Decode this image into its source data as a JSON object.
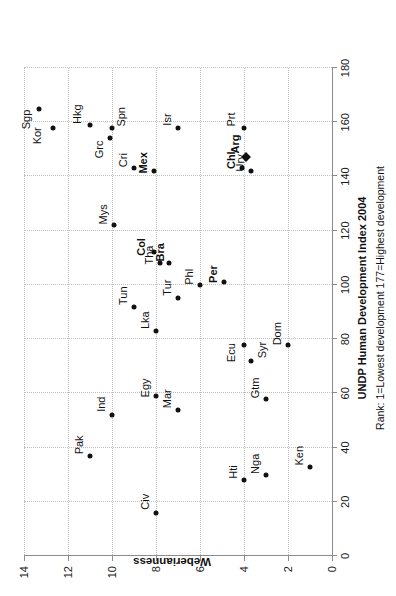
{
  "chart_data": {
    "type": "scatter",
    "title": "",
    "xlabel": "UNDP Human Development Index 2004",
    "xsublabel": "Rank: 1=Lowest development  177=Highest development",
    "ylabel": "Weberianness",
    "xlim": [
      0,
      180
    ],
    "ylim": [
      0,
      14
    ],
    "xticks": [
      0,
      20,
      40,
      60,
      80,
      100,
      120,
      140,
      160,
      180
    ],
    "yticks": [
      0,
      2,
      4,
      6,
      8,
      10,
      12,
      14
    ],
    "grid": "dotted-both",
    "legend": "none",
    "marker_colors": {
      "point": "#111111",
      "grid": "#bfbfbf",
      "axis": "#8c8c8c"
    },
    "points": [
      {
        "label": "Sgp",
        "x": 165,
        "y": 13.3,
        "bold": false,
        "marker": "circle",
        "lx": 161,
        "ly": 13.9
      },
      {
        "label": "Kor",
        "x": 158,
        "y": 12.7,
        "bold": false,
        "marker": "circle",
        "lx": 155,
        "ly": 13.4
      },
      {
        "label": "Hkg",
        "x": 159,
        "y": 11.0,
        "bold": false,
        "marker": "circle",
        "lx": 163,
        "ly": 11.6
      },
      {
        "label": "Grc",
        "x": 154,
        "y": 10.1,
        "bold": false,
        "marker": "circle",
        "lx": 150,
        "ly": 10.6
      },
      {
        "label": "Spn",
        "x": 158,
        "y": 10.0,
        "bold": false,
        "marker": "circle",
        "lx": 162,
        "ly": 9.6
      },
      {
        "label": "Isr",
        "x": 158,
        "y": 7.0,
        "bold": false,
        "marker": "circle",
        "lx": 161,
        "ly": 7.5
      },
      {
        "label": "Prt",
        "x": 158,
        "y": 4.0,
        "bold": false,
        "marker": "circle",
        "lx": 161,
        "ly": 4.6
      },
      {
        "label": "Cri",
        "x": 143,
        "y": 9.0,
        "bold": false,
        "marker": "circle",
        "lx": 146,
        "ly": 9.5
      },
      {
        "label": "Mex",
        "x": 142,
        "y": 8.1,
        "bold": true,
        "marker": "circle",
        "lx": 145,
        "ly": 8.6
      },
      {
        "label": "Chl",
        "x": 143,
        "y": 4.1,
        "bold": true,
        "marker": "circle",
        "lx": 146,
        "ly": 4.6
      },
      {
        "label": "Ury",
        "x": 142,
        "y": 3.7,
        "bold": false,
        "marker": "circle",
        "lx": 145,
        "ly": 4.2
      },
      {
        "label": "Arg",
        "x": 147,
        "y": 3.9,
        "bold": true,
        "marker": "diamond",
        "lx": 152,
        "ly": 4.4
      },
      {
        "label": "Mys",
        "x": 122,
        "y": 9.9,
        "bold": false,
        "marker": "circle",
        "lx": 126,
        "ly": 10.4
      },
      {
        "label": "Col",
        "x": 112,
        "y": 8.1,
        "bold": true,
        "marker": "circle",
        "lx": 114,
        "ly": 8.7
      },
      {
        "label": "Tha",
        "x": 108,
        "y": 7.8,
        "bold": false,
        "marker": "circle",
        "lx": 111,
        "ly": 8.3
      },
      {
        "label": "Bra",
        "x": 108,
        "y": 7.4,
        "bold": true,
        "marker": "circle",
        "lx": 112,
        "ly": 7.8
      },
      {
        "label": "Tun",
        "x": 92,
        "y": 9.0,
        "bold": false,
        "marker": "circle",
        "lx": 96,
        "ly": 9.5
      },
      {
        "label": "Lka",
        "x": 83,
        "y": 8.0,
        "bold": false,
        "marker": "circle",
        "lx": 87,
        "ly": 8.5
      },
      {
        "label": "Tur",
        "x": 95,
        "y": 7.0,
        "bold": false,
        "marker": "circle",
        "lx": 99,
        "ly": 7.5
      },
      {
        "label": "Phl",
        "x": 100,
        "y": 6.0,
        "bold": false,
        "marker": "circle",
        "lx": 103,
        "ly": 6.5
      },
      {
        "label": "Per",
        "x": 101,
        "y": 4.9,
        "bold": true,
        "marker": "circle",
        "lx": 104,
        "ly": 5.4
      },
      {
        "label": "Egy",
        "x": 59,
        "y": 8.0,
        "bold": false,
        "marker": "circle",
        "lx": 62,
        "ly": 8.5
      },
      {
        "label": "Mar",
        "x": 54,
        "y": 7.0,
        "bold": false,
        "marker": "circle",
        "lx": 58,
        "ly": 7.5
      },
      {
        "label": "Ind",
        "x": 52,
        "y": 10.0,
        "bold": false,
        "marker": "circle",
        "lx": 56,
        "ly": 10.5
      },
      {
        "label": "Pak",
        "x": 37,
        "y": 11.0,
        "bold": false,
        "marker": "circle",
        "lx": 41,
        "ly": 11.5
      },
      {
        "label": "Civ",
        "x": 16,
        "y": 8.0,
        "bold": false,
        "marker": "circle",
        "lx": 20,
        "ly": 8.5
      },
      {
        "label": "Ecu",
        "x": 78,
        "y": 4.0,
        "bold": false,
        "marker": "circle",
        "lx": 75,
        "ly": 4.6
      },
      {
        "label": "Syr",
        "x": 72,
        "y": 3.7,
        "bold": false,
        "marker": "circle",
        "lx": 76,
        "ly": 3.2
      },
      {
        "label": "Gtm",
        "x": 58,
        "y": 3.0,
        "bold": false,
        "marker": "circle",
        "lx": 62,
        "ly": 3.5
      },
      {
        "label": "Dom",
        "x": 78,
        "y": 2.0,
        "bold": false,
        "marker": "circle",
        "lx": 82,
        "ly": 2.5
      },
      {
        "label": "Hti",
        "x": 28,
        "y": 4.0,
        "bold": false,
        "marker": "circle",
        "lx": 31,
        "ly": 4.5
      },
      {
        "label": "Nga",
        "x": 30,
        "y": 3.0,
        "bold": false,
        "marker": "circle",
        "lx": 34,
        "ly": 3.5
      },
      {
        "label": "Ken",
        "x": 33,
        "y": 1.0,
        "bold": false,
        "marker": "circle",
        "lx": 37,
        "ly": 1.5
      }
    ]
  }
}
